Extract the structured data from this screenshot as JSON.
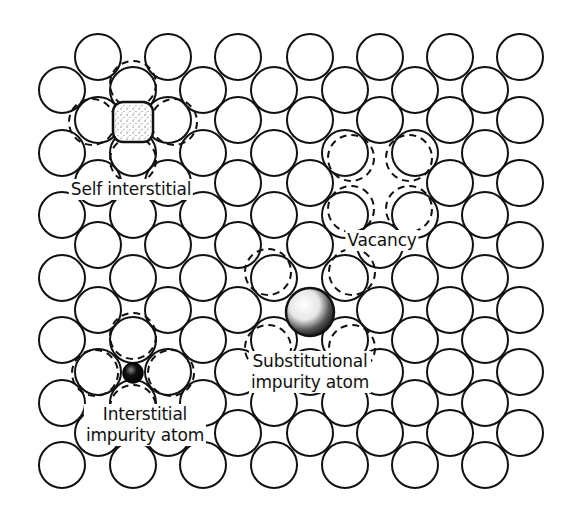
{
  "figure": {
    "colors": {
      "outline": "#111111",
      "background": "#ffffff",
      "stipple": "#333333",
      "substitutional_fill": "#111111"
    },
    "lattice": {
      "columns_x": [
        62,
        98,
        133,
        168,
        203,
        238,
        274,
        310,
        345,
        380,
        415,
        450,
        485,
        520
      ],
      "rows_y": [
        57,
        90,
        120,
        153,
        183,
        215,
        245,
        278,
        310,
        340,
        372,
        403,
        433,
        465
      ],
      "atom_radius": 23,
      "pattern": "checkerboard: even rows use odd column indices, odd rows use even column indices"
    },
    "defects": {
      "self_interstitial": {
        "label": "Self interstitial",
        "atom": {
          "x": 133,
          "y": 122,
          "size": 40
        },
        "displaced_neighbors": [
          {
            "x": 133,
            "y": 84
          },
          {
            "x": 92,
            "y": 122
          },
          {
            "x": 174,
            "y": 122
          },
          {
            "x": 133,
            "y": 160
          }
        ],
        "label_pos": {
          "x": 131,
          "y": 179
        }
      },
      "vacancy": {
        "label": "Vacancy",
        "removed": {
          "x": 380,
          "y": 183
        },
        "relaxed_neighbors": [
          {
            "x": 351,
            "y": 158
          },
          {
            "x": 409,
            "y": 158
          },
          {
            "x": 351,
            "y": 209
          },
          {
            "x": 409,
            "y": 209
          }
        ],
        "label_pos": {
          "x": 382,
          "y": 230
        }
      },
      "substitutional": {
        "label_line1": "Substitutional",
        "label_line2": "impurity atom",
        "atom": {
          "x": 310,
          "y": 312,
          "r": 24
        },
        "replaced": {
          "x": 310,
          "y": 310
        },
        "displaced_neighbors": [
          {
            "x": 268,
            "y": 272
          },
          {
            "x": 352,
            "y": 272
          },
          {
            "x": 268,
            "y": 348
          },
          {
            "x": 352,
            "y": 348
          }
        ],
        "label_pos": {
          "x": 310,
          "y": 351
        }
      },
      "interstitial_impurity": {
        "label_line1": "Interstitial",
        "label_line2": "impurity atom",
        "atom": {
          "x": 133,
          "y": 373,
          "r": 10
        },
        "displaced_neighbors": [
          {
            "x": 133,
            "y": 336
          },
          {
            "x": 95,
            "y": 373
          },
          {
            "x": 171,
            "y": 373
          },
          {
            "x": 133,
            "y": 408
          }
        ],
        "label_pos": {
          "x": 145,
          "y": 404
        }
      }
    }
  }
}
